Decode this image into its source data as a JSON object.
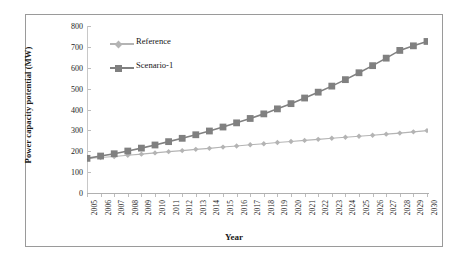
{
  "chart_data": {
    "type": "line",
    "title": "",
    "xlabel": "Year",
    "ylabel": "Power capacity potential (MW)",
    "categories": [
      "2005",
      "2006",
      "2007",
      "2008",
      "2009",
      "2010",
      "2011",
      "2012",
      "2013",
      "2014",
      "2015",
      "2016",
      "2017",
      "2018",
      "2019",
      "2020",
      "2021",
      "2022",
      "2023",
      "2024",
      "2025",
      "2026",
      "2027",
      "2028",
      "2029",
      "2030"
    ],
    "ylim": [
      0,
      800
    ],
    "yticks": [
      0,
      100,
      200,
      300,
      400,
      500,
      600,
      700,
      800
    ],
    "ytick_labels": [
      "0",
      "100",
      "200",
      "300",
      "400",
      "500",
      "600",
      "700",
      "800"
    ],
    "grid": false,
    "legend_position": "upper left inside plot",
    "series": [
      {
        "name": "Reference",
        "color": "#b4b4b4",
        "marker": "diamond",
        "values": [
          165,
          170,
          175,
          181,
          186,
          192,
          198,
          203,
          209,
          214,
          220,
          225,
          231,
          236,
          242,
          247,
          252,
          257,
          262,
          267,
          272,
          277,
          282,
          287,
          293,
          299
        ]
      },
      {
        "name": "Scenario-1",
        "color": "#808080",
        "marker": "square",
        "values": [
          166,
          177,
          188,
          201,
          215,
          230,
          246,
          262,
          279,
          297,
          316,
          336,
          357,
          379,
          403,
          428,
          455,
          483,
          512,
          543,
          576,
          610,
          646,
          683,
          705,
          726
        ]
      }
    ]
  },
  "legend": {
    "items": [
      {
        "label": "Reference"
      },
      {
        "label": "Scenario-1"
      }
    ]
  },
  "axis": {
    "x_title": "Year",
    "y_title": "Power capacity potential (MW)"
  },
  "colors": {
    "reference": "#b4b4b4",
    "scenario1": "#808080",
    "frame": "#9a9a9a",
    "text": "#1a1a1a"
  }
}
